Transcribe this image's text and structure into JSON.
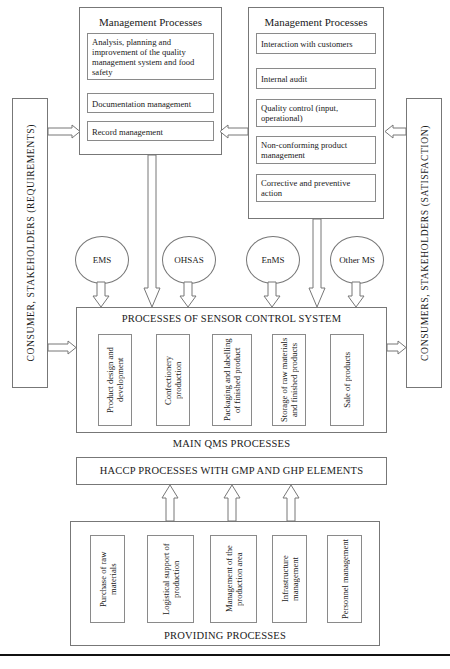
{
  "diagram": {
    "left_axis": {
      "label": "CONSUMER, STAKEHOLDERS (REQUIREMENTS)"
    },
    "right_axis": {
      "label": "CONSUMERS, STAKEHOLDERS (SATISFACTION)"
    },
    "management_left": {
      "title": "Management Processes",
      "items": [
        "Analysis, planning and improvement of the quality management system and food safety",
        "Documentation management",
        "Record management"
      ]
    },
    "management_right": {
      "title": "Management Processes",
      "items": [
        "Interaction with customers",
        "Internal audit",
        "Quality control (input, operational)",
        "Non-conforming product management",
        "Corrective and preventive action"
      ]
    },
    "standards": [
      "EMS",
      "OHSAS",
      "EnMS",
      "Other  MS"
    ],
    "core": {
      "title": "PROCESSES OF SENSOR CONTROL SYSTEM",
      "main_processes": [
        "Product design and development",
        "Confectionery production",
        "Packaging and labelling of finished product",
        "Storage of raw materials and finished products",
        "Sale of products"
      ],
      "main_caption": "MAIN QMS PROCESSES",
      "haccp_caption": "HACCP PROCESSES WITH GMP AND GHP ELEMENTS"
    },
    "providing": {
      "caption": "PROVIDING PROCESSES",
      "items": [
        "Purchase of raw materials",
        "Logistical support of production",
        "Management of the production area",
        "Infrastructure management",
        "Personnel management"
      ]
    },
    "colors": {
      "stroke": "#777777",
      "text": "#1a1a1a",
      "rule": "#111111"
    }
  }
}
